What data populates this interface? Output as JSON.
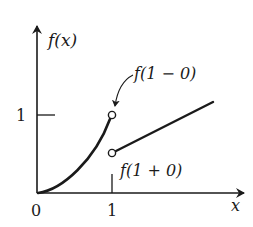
{
  "diagram": {
    "type": "function-graph-jump-discontinuity",
    "axes": {
      "y_label": "f(x)",
      "x_label": "x",
      "origin_label": "0",
      "x_tick_label": "1",
      "y_tick_label": "1"
    },
    "annotations": {
      "left_limit": "f(1 − 0)",
      "right_limit": "f(1 + 0)"
    },
    "colors": {
      "ink": "#1a1a1a",
      "background": "#ffffff"
    }
  }
}
